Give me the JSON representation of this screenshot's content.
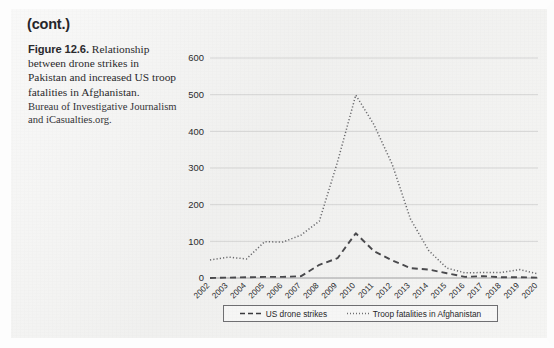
{
  "page": {
    "continued_label": "(cont.)"
  },
  "caption": {
    "figure_number": "Figure 12.6.",
    "text": "Relationship between drone strikes in Pakistan and increased US troop fatalities in Afghanistan.",
    "source": "Bureau of Investigative Journalism and iCasualties.org."
  },
  "colors": {
    "ink": "#2a2a2d",
    "axis": "#8a8a8d",
    "grid": "#c9c9c9",
    "series_drone": "#4a4a4d",
    "series_troops": "#6a6a6d",
    "page_background": "#f2f2f1"
  },
  "chart_data": {
    "type": "line",
    "title": "",
    "xlabel": "",
    "ylabel": "",
    "ylim": [
      0,
      600
    ],
    "yticks": [
      0,
      100,
      200,
      300,
      400,
      500,
      600
    ],
    "grid": true,
    "legend_position": "bottom",
    "categories": [
      "2002",
      "2003",
      "2004",
      "2005",
      "2006",
      "2007",
      "2008",
      "2009",
      "2010",
      "2011",
      "2012",
      "2013",
      "2014",
      "2015",
      "2016",
      "2017",
      "2018",
      "2019",
      "2020"
    ],
    "series": [
      {
        "name": "US drone strikes",
        "style": "dashed",
        "values": [
          0,
          1,
          2,
          3,
          3,
          5,
          36,
          54,
          122,
          73,
          48,
          27,
          23,
          13,
          3,
          5,
          2,
          2,
          1
        ]
      },
      {
        "name": "Troop fatalities in Afghanistan",
        "style": "dotted",
        "values": [
          49,
          57,
          52,
          99,
          98,
          117,
          155,
          317,
          499,
          418,
          310,
          161,
          75,
          27,
          14,
          15,
          15,
          23,
          11
        ]
      }
    ]
  },
  "legend": {
    "entries": [
      {
        "label": "US drone strikes",
        "style": "dashed"
      },
      {
        "label": "Troop fatalities in Afghanistan",
        "style": "dotted"
      }
    ]
  }
}
